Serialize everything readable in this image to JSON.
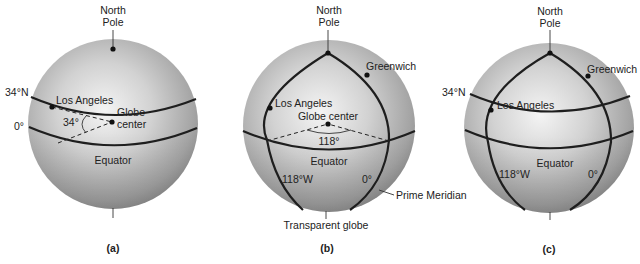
{
  "figure": {
    "panels": [
      {
        "id": "a",
        "caption": "(a)",
        "labels": {
          "north_pole_line1": "North",
          "north_pole_line2": "Pole",
          "lat_34n": "34°N",
          "lat_0": "0°",
          "los_angeles": "Los Angeles",
          "globe_center_line1": "Globe",
          "globe_center_line2": "center",
          "angle": "34°",
          "equator": "Equator"
        }
      },
      {
        "id": "b",
        "caption": "(b)",
        "labels": {
          "north_pole_line1": "North",
          "north_pole_line2": "Pole",
          "greenwich": "Greenwich",
          "los_angeles": "Los Angeles",
          "globe_center": "Globe center",
          "angle": "118°",
          "equator": "Equator",
          "lon_118w": "118°W",
          "lon_0": "0°",
          "prime_meridian": "Prime Meridian",
          "transparent_globe": "Transparent globe"
        }
      },
      {
        "id": "c",
        "caption": "(c)",
        "labels": {
          "north_pole_line1": "North",
          "north_pole_line2": "Pole",
          "greenwich": "Greenwich",
          "lat_34n": "34°N",
          "los_angeles": "Los Angeles",
          "equator": "Equator",
          "lon_118w": "118°W",
          "lon_0": "0°"
        }
      }
    ],
    "colors": {
      "globe_highlight": "#f2f2f2",
      "globe_mid": "#c4c4c4",
      "globe_edge": "#8c8c8c",
      "line": "#1e1e1e"
    }
  }
}
